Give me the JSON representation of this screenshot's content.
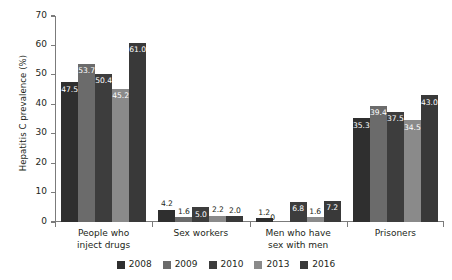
{
  "chart_data": {
    "type": "bar",
    "title": "",
    "subtitle": "",
    "xlabel": "",
    "ylabel": "Hepatitis C prevalence (%)",
    "ylim": [
      0,
      70
    ],
    "ytick_labels": [
      "0",
      "10",
      "20",
      "30",
      "40",
      "50",
      "60",
      "70"
    ],
    "ytick_values": [
      0,
      10,
      20,
      30,
      40,
      50,
      60,
      70
    ],
    "grid": false,
    "legend_position": "bottom-center",
    "categories": [
      "People who inject drugs",
      "Sex workers",
      "Men who have sex with men",
      "Prisoners"
    ],
    "category_lines": [
      [
        "People who",
        "inject drugs"
      ],
      [
        "Sex workers"
      ],
      [
        "Men who have",
        "sex with men"
      ],
      [
        "Prisoners"
      ]
    ],
    "series": [
      {
        "name": "2008",
        "color": "#2f2f2f",
        "values": [
          47.5,
          4.2,
          1.2,
          35.3
        ],
        "labels": [
          "47.5",
          "4.2",
          "1.2",
          "35.3"
        ]
      },
      {
        "name": "2009",
        "color": "#6b6b6b",
        "values": [
          53.7,
          1.6,
          0,
          39.4
        ],
        "labels": [
          "53.7",
          "1.6",
          "0",
          "39.4"
        ]
      },
      {
        "name": "2010",
        "color": "#3d3d3d",
        "values": [
          50.4,
          5.0,
          6.8,
          37.5
        ],
        "labels": [
          "50.4",
          "5.0",
          "6.8",
          "37.5"
        ]
      },
      {
        "name": "2013",
        "color": "#8a8a8a",
        "values": [
          45.2,
          2.2,
          1.6,
          34.5
        ],
        "labels": [
          "45.2",
          "2.2",
          "1.6",
          "34.5"
        ]
      },
      {
        "name": "2016",
        "color": "#393939",
        "values": [
          61.0,
          2.0,
          7.2,
          43.0
        ],
        "labels": [
          "61.0",
          "2.0",
          "7.2",
          "43.0"
        ]
      }
    ]
  },
  "axis": {
    "axis_color": "#7b7b7b"
  }
}
